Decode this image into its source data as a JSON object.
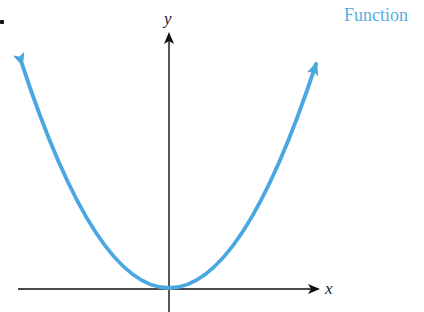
{
  "title": "Function",
  "axes": {
    "x_label": "x",
    "y_label": "y"
  },
  "curve": {
    "description": "parabola y = x^2 opening upward with vertex at origin",
    "color": "#4aa8e0"
  },
  "colors": {
    "axis": "#111111",
    "curve": "#4aa8e0",
    "title": "#5aaee0"
  }
}
